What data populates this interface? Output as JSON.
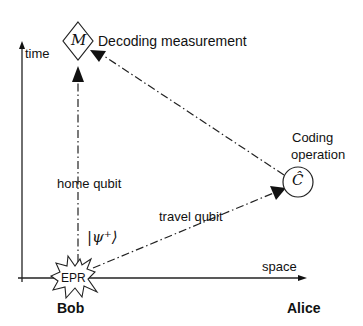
{
  "axes": {
    "vertical_label": "time",
    "horizontal_label": "space"
  },
  "nodes": {
    "measurement": {
      "symbol": "M",
      "label": "Decoding measurement",
      "shape": "diamond"
    },
    "coding": {
      "symbol": "Ĉ",
      "label_line1": "Coding",
      "label_line2": "operation",
      "shape": "circle"
    },
    "source": {
      "symbol": "EPR",
      "shape": "starburst"
    }
  },
  "edges": {
    "home": {
      "label": "home qubit",
      "from": "EPR",
      "to": "M",
      "style": "dash-dot"
    },
    "travel": {
      "label": "travel qubit",
      "from": "EPR",
      "to": "Ĉ",
      "style": "dash-dot"
    },
    "return": {
      "label": "",
      "from": "Ĉ",
      "to": "M",
      "style": "dash-dot"
    }
  },
  "state": {
    "ket": "|ψ⁺⟩"
  },
  "parties": {
    "left": "Bob",
    "right": "Alice"
  },
  "colors": {
    "ink": "#111111",
    "background": "#ffffff"
  }
}
